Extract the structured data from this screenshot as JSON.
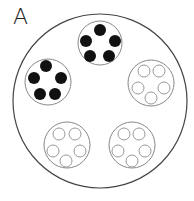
{
  "panel_label": "A",
  "colors": {
    "outer_stroke": "#444444",
    "group_stroke": "#888888",
    "filled_dot": "#111111",
    "empty_dot_stroke": "#999999",
    "background": "#ffffff"
  },
  "outer_circle": {
    "cx": 100,
    "cy": 101,
    "r": 87
  },
  "groups": [
    {
      "name": "top",
      "filled": true,
      "cx": 100,
      "cy": 43,
      "r": 22,
      "dots": [
        [
          100,
          30
        ],
        [
          115,
          41
        ],
        [
          109,
          56
        ],
        [
          90,
          56
        ],
        [
          86,
          41
        ]
      ]
    },
    {
      "name": "left",
      "filled": true,
      "cx": 48,
      "cy": 82,
      "r": 23,
      "dots": [
        [
          46,
          66
        ],
        [
          61,
          78
        ],
        [
          55,
          94
        ],
        [
          40,
          94
        ],
        [
          34,
          78
        ]
      ]
    },
    {
      "name": "right",
      "filled": false,
      "cx": 151,
      "cy": 83,
      "r": 23,
      "dots": [
        [
          144,
          71
        ],
        [
          159,
          71
        ],
        [
          164,
          88
        ],
        [
          151,
          98
        ],
        [
          138,
          88
        ]
      ]
    },
    {
      "name": "bottom-left",
      "filled": false,
      "cx": 67,
      "cy": 145,
      "r": 23,
      "dots": [
        [
          59,
          134
        ],
        [
          75,
          134
        ],
        [
          80,
          151
        ],
        [
          66,
          161
        ],
        [
          53,
          151
        ]
      ]
    },
    {
      "name": "bottom-right",
      "filled": false,
      "cx": 132,
      "cy": 145,
      "r": 23,
      "dots": [
        [
          124,
          134
        ],
        [
          139,
          134
        ],
        [
          145,
          151
        ],
        [
          132,
          161
        ],
        [
          118,
          151
        ]
      ]
    }
  ],
  "dot_radius": 6
}
